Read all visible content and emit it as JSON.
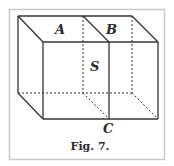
{
  "figure": {
    "caption": "Fig. 7.",
    "labels": {
      "a": "A",
      "b": "B",
      "s": "S",
      "c": "C"
    },
    "colors": {
      "line": "#333333",
      "frame": "#c8c8c8",
      "background": "#ffffff"
    }
  }
}
